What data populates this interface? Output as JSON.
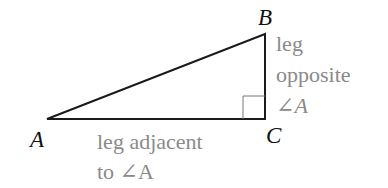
{
  "diagram": {
    "type": "right-triangle",
    "vertices": {
      "A": {
        "label": "A",
        "x": 47,
        "y": 119
      },
      "B": {
        "label": "B",
        "x": 265,
        "y": 34
      },
      "C": {
        "label": "C",
        "x": 265,
        "y": 119
      }
    },
    "right_angle_at": "C",
    "labels": {
      "opposite_line1": "leg",
      "opposite_line2": "opposite",
      "opposite_line3": "∠A",
      "adjacent_line1": "leg adjacent",
      "adjacent_line2": "to ∠A"
    },
    "colors": {
      "lines": "#1a1a1a",
      "vertex_labels": "#111111",
      "leg_labels": "#8a8a8a"
    }
  }
}
